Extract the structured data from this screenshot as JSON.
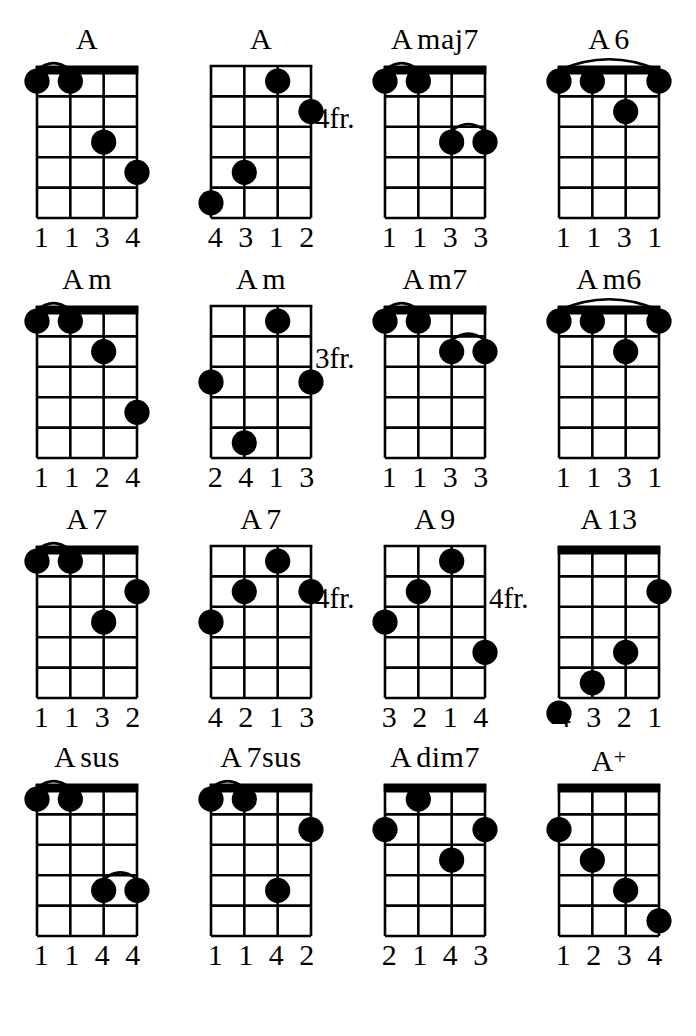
{
  "page": {
    "background": "#ffffff",
    "ink": "#000000",
    "columns": 4,
    "rows": 4,
    "strings": 4,
    "frets": 5
  },
  "chords": [
    {
      "name": "A",
      "name_parts": [
        {
          "text": "A",
          "style": "base"
        }
      ],
      "position_label": "",
      "open_nut": true,
      "dots": [
        {
          "string": 1,
          "fret": 1
        },
        {
          "string": 2,
          "fret": 1
        },
        {
          "string": 3,
          "fret": 3
        },
        {
          "string": 4,
          "fret": 4
        }
      ],
      "barres": [
        {
          "fret": 1,
          "from_string": 1,
          "to_string": 2
        }
      ],
      "fingers": [
        "1",
        "1",
        "3",
        "4"
      ]
    },
    {
      "name": "A",
      "name_parts": [
        {
          "text": "A",
          "style": "base"
        }
      ],
      "position_label": "4fr.",
      "open_nut": false,
      "dots": [
        {
          "string": 3,
          "fret": 1
        },
        {
          "string": 4,
          "fret": 2
        },
        {
          "string": 2,
          "fret": 4
        },
        {
          "string": 1,
          "fret": 5
        }
      ],
      "barres": [],
      "fingers": [
        "4",
        "3",
        "1",
        "2"
      ]
    },
    {
      "name": "Amaj7",
      "name_parts": [
        {
          "text": "A",
          "style": "base"
        },
        {
          "text": "maj7",
          "style": "base"
        }
      ],
      "position_label": "",
      "open_nut": true,
      "dots": [
        {
          "string": 1,
          "fret": 1
        },
        {
          "string": 2,
          "fret": 1
        },
        {
          "string": 3,
          "fret": 3
        },
        {
          "string": 4,
          "fret": 3
        }
      ],
      "barres": [
        {
          "fret": 1,
          "from_string": 1,
          "to_string": 2
        },
        {
          "fret": 3,
          "from_string": 3,
          "to_string": 4
        }
      ],
      "fingers": [
        "1",
        "1",
        "3",
        "3"
      ]
    },
    {
      "name": "A6",
      "name_parts": [
        {
          "text": "A",
          "style": "base"
        },
        {
          "text": "6",
          "style": "base"
        }
      ],
      "position_label": "",
      "open_nut": true,
      "dots": [
        {
          "string": 1,
          "fret": 1
        },
        {
          "string": 2,
          "fret": 1
        },
        {
          "string": 3,
          "fret": 2
        },
        {
          "string": 4,
          "fret": 1
        }
      ],
      "barres": [
        {
          "fret": 1,
          "from_string": 1,
          "to_string": 4
        }
      ],
      "fingers": [
        "1",
        "1",
        "3",
        "1"
      ]
    },
    {
      "name": "Am",
      "name_parts": [
        {
          "text": "A",
          "style": "base"
        },
        {
          "text": "m",
          "style": "base"
        }
      ],
      "position_label": "",
      "open_nut": true,
      "dots": [
        {
          "string": 1,
          "fret": 1
        },
        {
          "string": 2,
          "fret": 1
        },
        {
          "string": 3,
          "fret": 2
        },
        {
          "string": 4,
          "fret": 4
        }
      ],
      "barres": [
        {
          "fret": 1,
          "from_string": 1,
          "to_string": 2
        }
      ],
      "fingers": [
        "1",
        "1",
        "2",
        "4"
      ]
    },
    {
      "name": "Am",
      "name_parts": [
        {
          "text": "A",
          "style": "base"
        },
        {
          "text": "m",
          "style": "base"
        }
      ],
      "position_label": "3fr.",
      "open_nut": false,
      "dots": [
        {
          "string": 3,
          "fret": 1
        },
        {
          "string": 1,
          "fret": 3
        },
        {
          "string": 4,
          "fret": 3
        },
        {
          "string": 2,
          "fret": 5
        }
      ],
      "barres": [],
      "fingers": [
        "2",
        "4",
        "1",
        "3"
      ]
    },
    {
      "name": "Am7",
      "name_parts": [
        {
          "text": "A",
          "style": "base"
        },
        {
          "text": "m7",
          "style": "base"
        }
      ],
      "position_label": "",
      "open_nut": true,
      "dots": [
        {
          "string": 1,
          "fret": 1
        },
        {
          "string": 2,
          "fret": 1
        },
        {
          "string": 3,
          "fret": 2
        },
        {
          "string": 4,
          "fret": 2
        }
      ],
      "barres": [
        {
          "fret": 1,
          "from_string": 1,
          "to_string": 2
        },
        {
          "fret": 2,
          "from_string": 3,
          "to_string": 4
        }
      ],
      "fingers": [
        "1",
        "1",
        "3",
        "3"
      ]
    },
    {
      "name": "Am6",
      "name_parts": [
        {
          "text": "A",
          "style": "base"
        },
        {
          "text": "m6",
          "style": "base"
        }
      ],
      "position_label": "",
      "open_nut": true,
      "dots": [
        {
          "string": 1,
          "fret": 1
        },
        {
          "string": 2,
          "fret": 1
        },
        {
          "string": 3,
          "fret": 2
        },
        {
          "string": 4,
          "fret": 1
        }
      ],
      "barres": [
        {
          "fret": 1,
          "from_string": 1,
          "to_string": 4
        }
      ],
      "fingers": [
        "1",
        "1",
        "3",
        "1"
      ]
    },
    {
      "name": "A7",
      "name_parts": [
        {
          "text": "A",
          "style": "base"
        },
        {
          "text": "7",
          "style": "base"
        }
      ],
      "position_label": "",
      "open_nut": true,
      "dots": [
        {
          "string": 1,
          "fret": 1
        },
        {
          "string": 2,
          "fret": 1
        },
        {
          "string": 3,
          "fret": 3
        },
        {
          "string": 4,
          "fret": 2
        }
      ],
      "barres": [
        {
          "fret": 1,
          "from_string": 1,
          "to_string": 2
        }
      ],
      "fingers": [
        "1",
        "1",
        "3",
        "2"
      ]
    },
    {
      "name": "A7",
      "name_parts": [
        {
          "text": "A",
          "style": "base"
        },
        {
          "text": "7",
          "style": "base"
        }
      ],
      "position_label": "4fr.",
      "open_nut": false,
      "dots": [
        {
          "string": 3,
          "fret": 1
        },
        {
          "string": 2,
          "fret": 2
        },
        {
          "string": 4,
          "fret": 2
        },
        {
          "string": 1,
          "fret": 3
        }
      ],
      "barres": [],
      "fingers": [
        "4",
        "2",
        "1",
        "3"
      ]
    },
    {
      "name": "A9",
      "name_parts": [
        {
          "text": "A",
          "style": "base"
        },
        {
          "text": "9",
          "style": "base"
        }
      ],
      "position_label": "4fr.",
      "open_nut": false,
      "dots": [
        {
          "string": 3,
          "fret": 1
        },
        {
          "string": 2,
          "fret": 2
        },
        {
          "string": 1,
          "fret": 3
        },
        {
          "string": 4,
          "fret": 4
        }
      ],
      "barres": [],
      "fingers": [
        "3",
        "2",
        "1",
        "4"
      ]
    },
    {
      "name": "A13",
      "name_parts": [
        {
          "text": "A",
          "style": "base"
        },
        {
          "text": "13",
          "style": "base"
        }
      ],
      "position_label": "",
      "open_nut": true,
      "dots": [
        {
          "string": 4,
          "fret": 2
        },
        {
          "string": 3,
          "fret": 4
        },
        {
          "string": 2,
          "fret": 5
        },
        {
          "string": 1,
          "fret": 6
        }
      ],
      "barres": [],
      "fingers": [
        "4",
        "3",
        "2",
        "1"
      ]
    },
    {
      "name": "Asus",
      "name_parts": [
        {
          "text": "A",
          "style": "base"
        },
        {
          "text": "sus",
          "style": "base"
        }
      ],
      "position_label": "",
      "open_nut": true,
      "dots": [
        {
          "string": 1,
          "fret": 1
        },
        {
          "string": 2,
          "fret": 1
        },
        {
          "string": 3,
          "fret": 4
        },
        {
          "string": 4,
          "fret": 4
        }
      ],
      "barres": [
        {
          "fret": 1,
          "from_string": 1,
          "to_string": 2
        },
        {
          "fret": 4,
          "from_string": 3,
          "to_string": 4
        }
      ],
      "fingers": [
        "1",
        "1",
        "4",
        "4"
      ]
    },
    {
      "name": "A7sus",
      "name_parts": [
        {
          "text": "A",
          "style": "base"
        },
        {
          "text": "7sus",
          "style": "base"
        }
      ],
      "position_label": "",
      "open_nut": true,
      "dots": [
        {
          "string": 1,
          "fret": 1
        },
        {
          "string": 2,
          "fret": 1
        },
        {
          "string": 3,
          "fret": 4
        },
        {
          "string": 4,
          "fret": 2
        }
      ],
      "barres": [
        {
          "fret": 1,
          "from_string": 1,
          "to_string": 2
        }
      ],
      "fingers": [
        "1",
        "1",
        "4",
        "2"
      ]
    },
    {
      "name": "Adim7",
      "name_parts": [
        {
          "text": "A",
          "style": "base"
        },
        {
          "text": "dim7",
          "style": "base"
        }
      ],
      "position_label": "",
      "open_nut": true,
      "dots": [
        {
          "string": 2,
          "fret": 1
        },
        {
          "string": 1,
          "fret": 2
        },
        {
          "string": 4,
          "fret": 2
        },
        {
          "string": 3,
          "fret": 3
        }
      ],
      "barres": [],
      "fingers": [
        "2",
        "1",
        "4",
        "3"
      ]
    },
    {
      "name": "A+",
      "name_parts": [
        {
          "text": "A",
          "style": "base"
        },
        {
          "text": "+",
          "style": "sup"
        }
      ],
      "position_label": "",
      "open_nut": true,
      "dots": [
        {
          "string": 1,
          "fret": 2
        },
        {
          "string": 2,
          "fret": 3
        },
        {
          "string": 3,
          "fret": 4
        },
        {
          "string": 4,
          "fret": 5
        }
      ],
      "barres": [],
      "fingers": [
        "1",
        "2",
        "3",
        "4"
      ]
    }
  ]
}
